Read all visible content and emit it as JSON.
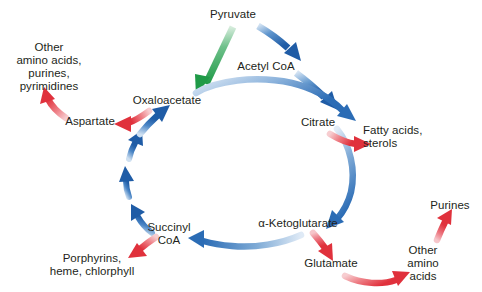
{
  "figure": {
    "background_color": "#ffffff",
    "colors": {
      "cycle_blue": "#2b6cb5",
      "cycle_blue_light": "#bcd3ec",
      "branch_red": "#e0313c",
      "branch_red_light": "#f3b9bd",
      "anaplerotic_green": "#22a04a",
      "anaplerotic_green_light": "#bfe3c8",
      "text": "#231f20"
    }
  },
  "nodes": {
    "pyruvate": {
      "label": "Pyruvate",
      "x": 233,
      "y": 8
    },
    "acetyl_coa": {
      "label": "Acetyl CoA",
      "x": 266,
      "y": 60
    },
    "citrate": {
      "label": "Citrate",
      "x": 318,
      "y": 116
    },
    "alpha_ketoglutarate": {
      "label": "α-Ketoglutarate",
      "x": 298,
      "y": 217
    },
    "succinyl_coa": {
      "label": "Succinyl\nCoA",
      "x": 169,
      "y": 221
    },
    "oxaloacetate": {
      "label": "Oxaloacetate",
      "x": 167,
      "y": 94
    },
    "aspartate": {
      "label": "Aspartate",
      "x": 90,
      "y": 115
    },
    "other_amino_acids_purines_pyrimidines": {
      "label": "Other\namino acids,\npurines,\npyrimidines",
      "x": 49,
      "y": 41
    },
    "fatty_acids_sterols": {
      "label": "Fatty acids,\nsterols",
      "x": 363,
      "y": 124
    },
    "glutamate": {
      "label": "Glutamate",
      "x": 331,
      "y": 257
    },
    "other_amino_acids": {
      "label": "Other\namino acids",
      "x": 423,
      "y": 244
    },
    "purines": {
      "label": "Purines",
      "x": 450,
      "y": 199
    },
    "porphyrins_heme_chlorophyll": {
      "label": "Porphyrins,\nheme, chlorphyll",
      "x": 92,
      "y": 252
    }
  },
  "arrows": [
    {
      "name": "pyruvate-to-oxaloacetate",
      "from": "pyruvate",
      "to": "oxaloacetate",
      "color": "anaplerotic_green",
      "kind": "anaplerotic"
    },
    {
      "name": "pyruvate-to-acetyl-coa",
      "from": "pyruvate",
      "to": "acetyl_coa",
      "color": "cycle_blue",
      "kind": "cycle"
    },
    {
      "name": "acetyl-coa-to-citrate",
      "from": "acetyl_coa",
      "to": "citrate",
      "color": "cycle_blue",
      "kind": "cycle"
    },
    {
      "name": "oxaloacetate-to-citrate",
      "from": "oxaloacetate",
      "to": "citrate",
      "color": "cycle_blue",
      "kind": "cycle"
    },
    {
      "name": "citrate-to-alpha-ketoglutarate",
      "from": "citrate",
      "to": "alpha_ketoglutarate",
      "color": "cycle_blue",
      "kind": "cycle"
    },
    {
      "name": "alpha-ketoglutarate-to-succinyl-coa",
      "from": "alpha_ketoglutarate",
      "to": "succinyl_coa",
      "color": "cycle_blue",
      "kind": "cycle"
    },
    {
      "name": "succinyl-coa-to-oxaloacetate",
      "from": "succinyl_coa",
      "to": "oxaloacetate",
      "color": "cycle_blue",
      "kind": "cycle-segmented"
    },
    {
      "name": "citrate-to-fatty-acids",
      "from": "citrate",
      "to": "fatty_acids_sterols",
      "color": "branch_red",
      "kind": "biosynthetic"
    },
    {
      "name": "alpha-ketoglutarate-to-glutamate",
      "from": "alpha_ketoglutarate",
      "to": "glutamate",
      "color": "branch_red",
      "kind": "biosynthetic"
    },
    {
      "name": "glutamate-to-other-amino-acids",
      "from": "glutamate",
      "to": "other_amino_acids",
      "color": "branch_red",
      "kind": "biosynthetic"
    },
    {
      "name": "other-amino-acids-to-purines",
      "from": "other_amino_acids",
      "to": "purines",
      "color": "branch_red",
      "kind": "biosynthetic"
    },
    {
      "name": "succinyl-coa-to-porphyrins",
      "from": "succinyl_coa",
      "to": "porphyrins_heme_chlorophyll",
      "color": "branch_red",
      "kind": "biosynthetic"
    },
    {
      "name": "oxaloacetate-to-aspartate",
      "from": "oxaloacetate",
      "to": "aspartate",
      "color": "branch_red",
      "kind": "biosynthetic"
    },
    {
      "name": "aspartate-to-other-amino-acids-purines-pyrimidines",
      "from": "aspartate",
      "to": "other_amino_acids_purines_pyrimidines",
      "color": "branch_red",
      "kind": "biosynthetic"
    }
  ]
}
